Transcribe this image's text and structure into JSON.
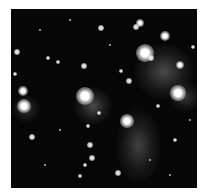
{
  "image": {
    "subject": "star cluster with reflection nebula",
    "colors": {
      "background": "#ffffff",
      "sky": "#060606",
      "star": "#ffffff"
    },
    "nebulae": [
      {
        "x": 134,
        "y": 44,
        "w": 60,
        "h": 55,
        "opacity": 0.35
      },
      {
        "x": 74,
        "y": 87,
        "w": 38,
        "h": 38,
        "opacity": 0.35
      },
      {
        "x": 116,
        "y": 108,
        "w": 45,
        "h": 75,
        "opacity": 0.3
      },
      {
        "x": 12,
        "y": 95,
        "w": 28,
        "h": 28,
        "opacity": 0.25
      },
      {
        "x": 168,
        "y": 82,
        "w": 34,
        "h": 30,
        "opacity": 0.25
      }
    ],
    "stars": [
      {
        "x": 145,
        "y": 53,
        "r": 9
      },
      {
        "x": 178,
        "y": 93,
        "r": 8
      },
      {
        "x": 85,
        "y": 96,
        "r": 9
      },
      {
        "x": 127,
        "y": 121,
        "r": 7
      },
      {
        "x": 24,
        "y": 106,
        "r": 7
      },
      {
        "x": 23,
        "y": 91,
        "r": 5
      },
      {
        "x": 140,
        "y": 23,
        "r": 4
      },
      {
        "x": 136,
        "y": 27,
        "r": 3
      },
      {
        "x": 165,
        "y": 36,
        "r": 5
      },
      {
        "x": 151,
        "y": 58,
        "r": 3
      },
      {
        "x": 180,
        "y": 65,
        "r": 4
      },
      {
        "x": 101,
        "y": 28,
        "r": 3
      },
      {
        "x": 17,
        "y": 52,
        "r": 3
      },
      {
        "x": 48,
        "y": 58,
        "r": 2
      },
      {
        "x": 84,
        "y": 66,
        "r": 3
      },
      {
        "x": 121,
        "y": 71,
        "r": 2
      },
      {
        "x": 129,
        "y": 81,
        "r": 3
      },
      {
        "x": 158,
        "y": 106,
        "r": 2
      },
      {
        "x": 99,
        "y": 113,
        "r": 2
      },
      {
        "x": 88,
        "y": 126,
        "r": 2
      },
      {
        "x": 32,
        "y": 137,
        "r": 3
      },
      {
        "x": 90,
        "y": 145,
        "r": 3
      },
      {
        "x": 92,
        "y": 158,
        "r": 3
      },
      {
        "x": 85,
        "y": 165,
        "r": 2
      },
      {
        "x": 118,
        "y": 173,
        "r": 3
      },
      {
        "x": 80,
        "y": 176,
        "r": 2
      },
      {
        "x": 193,
        "y": 47,
        "r": 2
      },
      {
        "x": 15,
        "y": 74,
        "r": 2
      },
      {
        "x": 58,
        "y": 62,
        "r": 2
      },
      {
        "x": 175,
        "y": 140,
        "r": 2
      },
      {
        "x": 60,
        "y": 130,
        "r": 1
      },
      {
        "x": 150,
        "y": 160,
        "r": 1
      },
      {
        "x": 40,
        "y": 30,
        "r": 1
      },
      {
        "x": 70,
        "y": 20,
        "r": 1
      },
      {
        "x": 110,
        "y": 45,
        "r": 1
      },
      {
        "x": 190,
        "y": 120,
        "r": 1
      },
      {
        "x": 45,
        "y": 165,
        "r": 1
      },
      {
        "x": 170,
        "y": 175,
        "r": 1
      }
    ]
  }
}
